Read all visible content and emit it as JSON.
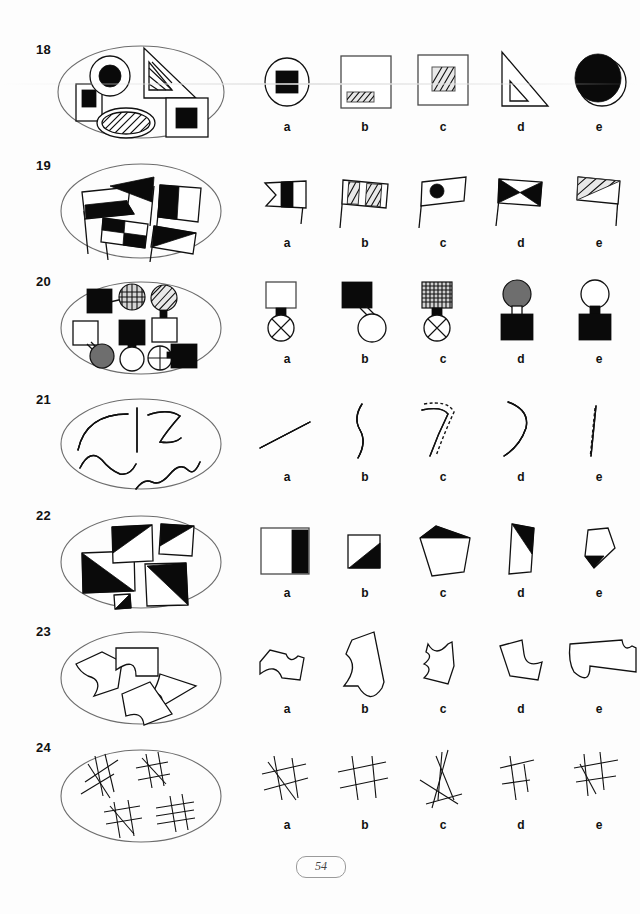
{
  "page": {
    "page_number": "54",
    "option_letters": [
      "a",
      "b",
      "c",
      "d",
      "e"
    ]
  },
  "items": [
    {
      "number": "18",
      "stimulus_description": "Ellipse containing: upright white rectangle with small black square inside, white circle with black filled circle inside, outlined right triangle with small hatched triangle inside, white ellipse with hatched ellipse inside, white square with black square inside",
      "options": [
        {
          "letter": "a",
          "description": "ellipse outline containing a black filled square"
        },
        {
          "letter": "b",
          "description": "large white square containing a small hatched rectangle near the bottom"
        },
        {
          "letter": "c",
          "description": "white square containing a hatched square"
        },
        {
          "letter": "d",
          "description": "outlined right triangle containing a small white triangle"
        },
        {
          "letter": "e",
          "description": "circle outline with a large black filled ellipse offset up-left"
        }
      ]
    },
    {
      "number": "19",
      "stimulus_description": "Ellipse containing five flags on poles: notched flag half black, solid black triangular pennant, flag half black half white, checkered four-square flag, flag with black triangle",
      "options": [
        {
          "letter": "a",
          "description": "swallow-tail notched flag with a black vertical band"
        },
        {
          "letter": "b",
          "description": "rectangular flag with two hatched panels"
        },
        {
          "letter": "c",
          "description": "rectangular flag with a black filled circle"
        },
        {
          "letter": "d",
          "description": "rectangular flag with black bow-tie / hourglass pattern"
        },
        {
          "letter": "e",
          "description": "rectangular flag with hatched upper-left triangle"
        }
      ]
    },
    {
      "number": "20",
      "stimulus_description": "Ellipse containing five square-and-circle pairs joined by a short stem: black square with cross-hatched circle, hatched circle above white square, white square with grey circle, black square with white circle, crossed circle with black square",
      "options": [
        {
          "letter": "a",
          "description": "white square above a circle with an X inside, joined by a black stem"
        },
        {
          "letter": "b",
          "description": "black square joined by a stem to a white circle"
        },
        {
          "letter": "c",
          "description": "cross-hatched square above a circle with an X inside"
        },
        {
          "letter": "d",
          "description": "grey filled circle above a black square"
        },
        {
          "letter": "e",
          "description": "white circle above a black square"
        }
      ]
    },
    {
      "number": "21",
      "stimulus_description": "Ellipse containing five double-outlined ribbon curves: arc, straight vertical, zigzag hook, wavy line, long wave",
      "options": [
        {
          "letter": "a",
          "description": "short straight double-line segment, tilted"
        },
        {
          "letter": "b",
          "description": "vertical wavy double line"
        },
        {
          "letter": "c",
          "description": "bent hook double line with dashed outline on one side"
        },
        {
          "letter": "d",
          "description": "S-curve double line"
        },
        {
          "letter": "e",
          "description": "vertical straight double line with dotted centre"
        }
      ]
    },
    {
      "number": "22",
      "stimulus_description": "Ellipse containing five squares each with a black triangular half or corner",
      "options": [
        {
          "letter": "a",
          "description": "square with a black vertical band along the right side"
        },
        {
          "letter": "b",
          "description": "small square with black lower-right triangle"
        },
        {
          "letter": "c",
          "description": "irregular pentagon with black triangle at the top"
        },
        {
          "letter": "d",
          "description": "tall narrow quadrilateral with black triangle at the top"
        },
        {
          "letter": "e",
          "description": "small pentagon with black triangle at lower left"
        }
      ]
    },
    {
      "number": "23",
      "stimulus_description": "Ellipse containing four irregular polygons each with one concave scalloped bite taken out of an edge",
      "options": [
        {
          "letter": "a",
          "description": "small irregular polygon with a concave notch on the top and bottom"
        },
        {
          "letter": "b",
          "description": "tall irregular shape with large concave bites on left and bottom"
        },
        {
          "letter": "c",
          "description": "narrow shape with concave notches on the top and left"
        },
        {
          "letter": "d",
          "description": "quadrilateral with a concave bite on the right edge"
        },
        {
          "letter": "e",
          "description": "wide shape with a large round bite on the bottom left"
        }
      ]
    },
    {
      "number": "24",
      "stimulus_description": "Ellipse containing four clusters of crossed tally-like straight strokes",
      "options": [
        {
          "letter": "a",
          "description": "cluster of five crossing strokes forming a hash pattern"
        },
        {
          "letter": "b",
          "description": "grid-like hash of two vertical and two horizontal strokes"
        },
        {
          "letter": "c",
          "description": "scattered strokes crossing near the bottom"
        },
        {
          "letter": "d",
          "description": "small hash with short horizontal strokes"
        },
        {
          "letter": "e",
          "description": "hash with three verticals and two horizontals"
        }
      ]
    }
  ]
}
